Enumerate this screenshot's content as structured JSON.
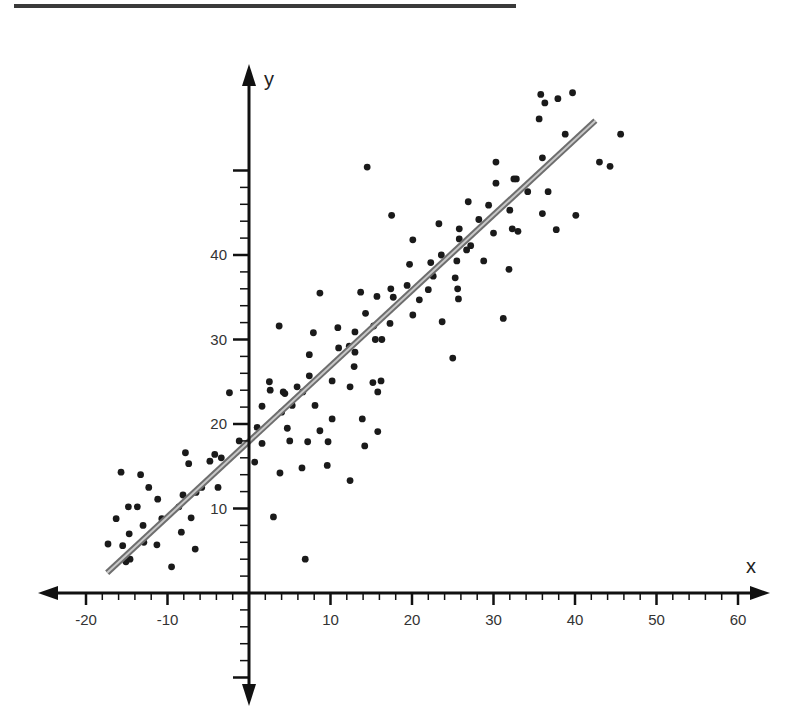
{
  "chart_data": {
    "type": "scatter",
    "title": "",
    "xlabel": "x",
    "ylabel": "y",
    "xlim": [
      -25,
      63
    ],
    "ylim": [
      -12,
      62
    ],
    "x_ticks": [
      -20,
      -10,
      10,
      20,
      30,
      40,
      50,
      60
    ],
    "x_tick_labels": [
      "-20",
      "-10",
      "10",
      "20",
      "30",
      "40",
      "50",
      "60"
    ],
    "y_ticks": [
      10,
      20,
      30,
      40,
      50
    ],
    "y_tick_labels": [
      "10",
      "20",
      "30",
      "40",
      ""
    ],
    "grid": false,
    "legend": null,
    "regression_line": {
      "x1": -17.4,
      "y1": 2.4,
      "x2": 42.5,
      "y2": 55.9,
      "slope": 0.89,
      "intercept": 17.9,
      "color": "#8a8a8a"
    },
    "point_color": "#1a1a1a",
    "points": [
      [
        -1.2,
        18.0
      ],
      [
        -7.8,
        16.6
      ],
      [
        -4.2,
        16.4
      ],
      [
        -3.4,
        16.0
      ],
      [
        -7.4,
        15.3
      ],
      [
        -4.8,
        15.6
      ],
      [
        -15.7,
        14.3
      ],
      [
        -13.3,
        14.0
      ],
      [
        -12.3,
        12.5
      ],
      [
        -3.8,
        12.5
      ],
      [
        -5.8,
        12.5
      ],
      [
        -6.5,
        11.9
      ],
      [
        -8.1,
        11.6
      ],
      [
        -11.2,
        11.1
      ],
      [
        -14.8,
        10.2
      ],
      [
        -13.7,
        10.2
      ],
      [
        -8.6,
        10.2
      ],
      [
        -16.3,
        8.8
      ],
      [
        -10.7,
        8.8
      ],
      [
        -7.1,
        8.9
      ],
      [
        -13.0,
        8.0
      ],
      [
        -14.7,
        7.0
      ],
      [
        -8.3,
        7.2
      ],
      [
        -17.3,
        5.8
      ],
      [
        -15.5,
        5.6
      ],
      [
        -12.9,
        6.0
      ],
      [
        -11.3,
        5.7
      ],
      [
        -6.6,
        5.2
      ],
      [
        -15.1,
        3.7
      ],
      [
        -14.6,
        4.0
      ],
      [
        -9.5,
        3.1
      ],
      [
        -2.4,
        23.7
      ],
      [
        8.7,
        35.5
      ],
      [
        13.7,
        35.6
      ],
      [
        15.7,
        35.1
      ],
      [
        17.4,
        36.0
      ],
      [
        17.7,
        35.0
      ],
      [
        14.3,
        33.1
      ],
      [
        3.7,
        31.6
      ],
      [
        10.9,
        31.4
      ],
      [
        7.9,
        30.8
      ],
      [
        13.0,
        30.9
      ],
      [
        15.3,
        31.6
      ],
      [
        17.3,
        31.9
      ],
      [
        15.5,
        30.0
      ],
      [
        16.3,
        30.0
      ],
      [
        11.0,
        29.0
      ],
      [
        12.3,
        29.2
      ],
      [
        13.0,
        28.5
      ],
      [
        7.4,
        28.2
      ],
      [
        12.9,
        26.8
      ],
      [
        7.4,
        25.7
      ],
      [
        2.5,
        25.0
      ],
      [
        10.2,
        25.1
      ],
      [
        16.2,
        25.1
      ],
      [
        15.2,
        24.9
      ],
      [
        2.6,
        24.0
      ],
      [
        5.9,
        24.4
      ],
      [
        12.4,
        24.4
      ],
      [
        4.4,
        23.6
      ],
      [
        6.6,
        23.8
      ],
      [
        15.8,
        23.8
      ],
      [
        4.2,
        23.8
      ],
      [
        1.6,
        22.1
      ],
      [
        5.3,
        22.2
      ],
      [
        8.1,
        22.2
      ],
      [
        4.0,
        21.4
      ],
      [
        10.2,
        20.6
      ],
      [
        13.9,
        20.6
      ],
      [
        1.0,
        19.6
      ],
      [
        4.7,
        19.5
      ],
      [
        8.7,
        19.2
      ],
      [
        15.8,
        19.1
      ],
      [
        1.6,
        17.7
      ],
      [
        5.0,
        18.0
      ],
      [
        7.2,
        17.9
      ],
      [
        9.7,
        17.9
      ],
      [
        14.2,
        17.4
      ],
      [
        0.7,
        15.5
      ],
      [
        3.8,
        14.2
      ],
      [
        6.5,
        14.8
      ],
      [
        9.6,
        15.1
      ],
      [
        12.4,
        13.3
      ],
      [
        3.0,
        9.0
      ],
      [
        6.9,
        4.0
      ],
      [
        14.5,
        50.4
      ],
      [
        30.3,
        51.0
      ],
      [
        32.8,
        49.0
      ],
      [
        30.3,
        48.5
      ],
      [
        34.2,
        47.5
      ],
      [
        26.9,
        46.3
      ],
      [
        29.4,
        45.9
      ],
      [
        32.0,
        45.3
      ],
      [
        17.5,
        44.7
      ],
      [
        28.2,
        44.2
      ],
      [
        23.3,
        43.7
      ],
      [
        25.8,
        43.1
      ],
      [
        32.3,
        43.1
      ],
      [
        33.0,
        42.8
      ],
      [
        30.0,
        42.6
      ],
      [
        25.8,
        41.9
      ],
      [
        20.1,
        41.8
      ],
      [
        27.2,
        41.1
      ],
      [
        26.7,
        40.6
      ],
      [
        23.6,
        40.0
      ],
      [
        19.7,
        38.9
      ],
      [
        22.3,
        39.1
      ],
      [
        25.5,
        39.3
      ],
      [
        28.8,
        39.3
      ],
      [
        31.9,
        38.3
      ],
      [
        22.6,
        37.5
      ],
      [
        25.3,
        37.3
      ],
      [
        19.4,
        36.4
      ],
      [
        22.0,
        35.9
      ],
      [
        25.6,
        36.0
      ],
      [
        20.9,
        34.7
      ],
      [
        25.7,
        34.8
      ],
      [
        20.1,
        32.9
      ],
      [
        23.7,
        32.1
      ],
      [
        31.2,
        32.5
      ],
      [
        25.0,
        27.8
      ],
      [
        35.8,
        59.0
      ],
      [
        36.3,
        58.0
      ],
      [
        37.9,
        58.5
      ],
      [
        39.7,
        59.2
      ],
      [
        35.6,
        56.1
      ],
      [
        38.8,
        54.3
      ],
      [
        45.6,
        54.3
      ],
      [
        36.0,
        51.5
      ],
      [
        43.0,
        51.0
      ],
      [
        44.3,
        50.5
      ],
      [
        32.5,
        49.0
      ],
      [
        36.7,
        47.5
      ],
      [
        36.0,
        44.9
      ],
      [
        40.1,
        44.7
      ],
      [
        37.7,
        43.0
      ]
    ]
  },
  "axes": {
    "x_name": "x",
    "y_name": "y"
  }
}
